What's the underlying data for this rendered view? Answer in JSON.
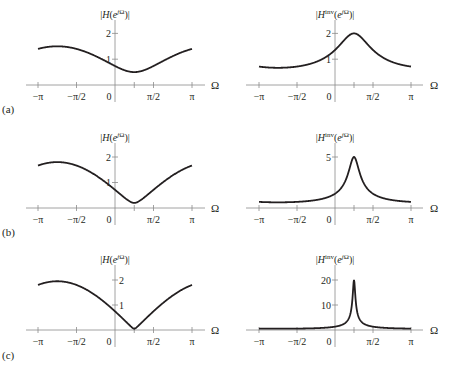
{
  "figure": {
    "panel_labels": [
      "(a)",
      "(b)",
      "(c)"
    ],
    "x_axis_symbol": "Ω",
    "x_tick_labels": [
      "−π",
      "−π/2",
      "0",
      "π/2",
      "π"
    ],
    "left_title": "|H(e^{jΩ})|",
    "right_title": "|H^{inv}(e^{jΩ})|",
    "colors": {
      "curve": "#231f20",
      "axis": "#8a8a8a"
    }
  },
  "chart_data": [
    {
      "type": "line",
      "panel": "(a)",
      "side": "left",
      "title": "|H(e^{jΩ})|",
      "xlabel": "Ω",
      "ylabel": "",
      "xlim": [
        -3.1416,
        3.1416
      ],
      "ylim": [
        0,
        2.3
      ],
      "x_ticks": [
        "−π",
        "−π/2",
        "0",
        "π/2",
        "π"
      ],
      "y_ticks": [
        1,
        2
      ],
      "a": 0.5,
      "formula": "|1 - a·e^{-j(Ω-π/4)}|",
      "points": {
        "x": [
          -3.1416,
          -2.3562,
          -1.5708,
          -0.7854,
          0,
          0.7854,
          1.5708,
          2.3562,
          3.1416
        ],
        "y": [
          1.46,
          1.5,
          1.46,
          1.33,
          0.74,
          0.5,
          0.74,
          1.12,
          1.46
        ]
      }
    },
    {
      "type": "line",
      "panel": "(a)",
      "side": "right",
      "title": "|H^{inv}(e^{jΩ})|",
      "xlabel": "Ω",
      "xlim": [
        -3.1416,
        3.1416
      ],
      "ylim": [
        0,
        2.3
      ],
      "x_ticks": [
        "−π",
        "−π/2",
        "0",
        "π/2",
        "π"
      ],
      "y_ticks": [
        1,
        2
      ],
      "a": 0.5,
      "formula": "1/|1 - a·e^{-j(Ω-π/4)}|",
      "points": {
        "x": [
          -3.1416,
          -2.3562,
          -1.5708,
          -0.7854,
          0,
          0.7854,
          1.5708,
          2.3562,
          3.1416
        ],
        "y": [
          0.68,
          0.67,
          0.68,
          0.75,
          1.35,
          2.0,
          1.35,
          0.89,
          0.68
        ]
      }
    },
    {
      "type": "line",
      "panel": "(b)",
      "side": "left",
      "title": "|H(e^{jΩ})|",
      "xlabel": "Ω",
      "xlim": [
        -3.1416,
        3.1416
      ],
      "ylim": [
        0,
        2.3
      ],
      "x_ticks": [
        "−π",
        "−π/2",
        "0",
        "π/2",
        "π"
      ],
      "y_ticks": [
        1,
        2
      ],
      "a": 0.8,
      "points": {
        "x": [
          -3.1416,
          -2.3562,
          -1.5708,
          -0.7854,
          0,
          0.7854,
          1.5708,
          2.3562,
          3.1416
        ],
        "y": [
          1.66,
          1.8,
          1.66,
          1.28,
          0.73,
          0.2,
          0.73,
          1.28,
          1.66
        ]
      }
    },
    {
      "type": "line",
      "panel": "(b)",
      "side": "right",
      "title": "|H^{inv}(e^{jΩ})|",
      "xlabel": "Ω",
      "xlim": [
        -3.1416,
        3.1416
      ],
      "ylim": [
        0,
        5.8
      ],
      "x_ticks": [
        "−π",
        "−π/2",
        "0",
        "π/2",
        "π"
      ],
      "y_ticks": [
        5
      ],
      "a": 0.8,
      "points": {
        "x": [
          -3.1416,
          -2.3562,
          -1.5708,
          -0.7854,
          0,
          0.7854,
          1.5708,
          2.3562,
          3.1416
        ],
        "y": [
          0.6,
          0.56,
          0.6,
          0.78,
          1.37,
          5.0,
          1.37,
          0.78,
          0.6
        ]
      }
    },
    {
      "type": "line",
      "panel": "(c)",
      "side": "left",
      "title": "|H(e^{jΩ})|",
      "xlabel": "Ω",
      "xlim": [
        -3.1416,
        3.1416
      ],
      "ylim": [
        0,
        2.3
      ],
      "x_ticks": [
        "−π",
        "−π/2",
        "0",
        "π/2",
        "π"
      ],
      "y_ticks": [
        1,
        2
      ],
      "a": 0.95,
      "points": {
        "x": [
          -3.1416,
          -2.3562,
          -1.5708,
          -0.7854,
          0,
          0.7854,
          1.5708,
          2.3562,
          3.1416
        ],
        "y": [
          1.81,
          1.95,
          1.81,
          1.39,
          0.76,
          0.05,
          0.76,
          1.39,
          1.81
        ]
      }
    },
    {
      "type": "line",
      "panel": "(c)",
      "side": "right",
      "title": "|H^{inv}(e^{jΩ})|",
      "xlabel": "Ω",
      "xlim": [
        -3.1416,
        3.1416
      ],
      "ylim": [
        0,
        23
      ],
      "x_ticks": [
        "−π",
        "−π/2",
        "0",
        "π/2",
        "π"
      ],
      "y_ticks": [
        10,
        20
      ],
      "a": 0.95,
      "points": {
        "x": [
          -3.1416,
          -2.3562,
          -1.5708,
          -0.7854,
          0,
          0.7854,
          1.5708,
          2.3562,
          3.1416
        ],
        "y": [
          0.55,
          0.51,
          0.55,
          0.72,
          1.32,
          20.0,
          1.32,
          0.72,
          0.55
        ]
      }
    }
  ]
}
